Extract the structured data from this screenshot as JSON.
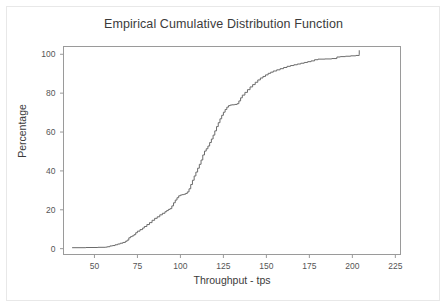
{
  "figure": {
    "width": 447,
    "height": 308,
    "background_color": "#ffffff",
    "border_color": "#e8e8e8",
    "title": "Empirical Cumulative Distribution Function"
  },
  "axes": {
    "title_color": "#3b3b3b",
    "frame_color": "#9a9a9a",
    "tick_label_color": "#555555",
    "line_color": "#6b6b6b"
  },
  "chart_data": {
    "type": "line",
    "title": "Empirical Cumulative Distribution Function",
    "xlabel": "Throughput - tps",
    "ylabel": "Percentage",
    "xlim": [
      32,
      228
    ],
    "ylim": [
      -3,
      104
    ],
    "xticks": [
      50,
      75,
      100,
      125,
      150,
      175,
      200,
      225
    ],
    "xtick_labels": [
      "50",
      "75",
      "100",
      "125",
      "150",
      "175",
      "200",
      "225"
    ],
    "yticks": [
      0,
      20,
      40,
      60,
      80,
      100
    ],
    "ytick_labels": [
      "0",
      "20",
      "40",
      "60",
      "80",
      "100"
    ],
    "grid": false,
    "legend": false,
    "step_style": "post",
    "series": [
      {
        "name": "ECDF",
        "color": "#6b6b6b",
        "line_width": 1,
        "x": [
          37.0,
          45.0,
          52.0,
          56.5,
          57.5,
          59.0,
          60.5,
          62.0,
          63.5,
          65.0,
          66.5,
          68.0,
          69.0,
          70.0,
          71.0,
          72.0,
          73.0,
          74.0,
          75.0,
          76.5,
          78.0,
          79.0,
          80.5,
          82.0,
          83.5,
          85.0,
          86.5,
          88.0,
          89.5,
          91.0,
          92.0,
          93.0,
          94.0,
          95.0,
          96.0,
          97.0,
          98.0,
          99.0,
          100.0,
          101.0,
          102.0,
          103.0,
          104.0,
          105.0,
          106.0,
          107.0,
          108.0,
          109.0,
          110.0,
          111.0,
          112.0,
          113.0,
          114.0,
          115.0,
          116.0,
          117.0,
          118.0,
          119.0,
          120.0,
          121.0,
          122.0,
          123.0,
          124.0,
          125.0,
          126.0,
          127.0,
          128.0,
          129.0,
          130.0,
          131.5,
          133.0,
          134.0,
          135.0,
          136.0,
          137.5,
          139.0,
          140.5,
          142.0,
          143.5,
          145.0,
          146.5,
          148.0,
          149.5,
          151.0,
          152.5,
          154.0,
          156.0,
          158.0,
          160.0,
          162.0,
          164.0,
          166.0,
          168.0,
          170.0,
          172.0,
          174.0,
          176.0,
          178.0,
          180.0,
          184.0,
          188.0,
          191.0,
          193.0,
          196.0,
          199.0,
          202.0,
          204.0
        ],
        "y": [
          0.5,
          0.6,
          0.7,
          0.8,
          1.0,
          1.4,
          1.6,
          2.0,
          2.4,
          2.8,
          3.2,
          3.8,
          4.4,
          5.6,
          6.2,
          6.6,
          7.2,
          8.2,
          9.0,
          9.8,
          10.6,
          11.4,
          12.4,
          13.4,
          14.6,
          15.6,
          16.4,
          17.4,
          18.2,
          19.0,
          19.6,
          20.2,
          20.6,
          22.0,
          23.6,
          25.0,
          26.2,
          27.2,
          27.6,
          27.8,
          28.0,
          28.4,
          29.2,
          30.8,
          33.0,
          35.2,
          37.4,
          39.4,
          41.4,
          43.4,
          45.6,
          48.2,
          50.2,
          51.4,
          52.8,
          54.6,
          56.4,
          58.4,
          60.6,
          62.8,
          64.8,
          66.8,
          68.6,
          70.2,
          71.6,
          72.8,
          73.6,
          73.9,
          74.0,
          74.2,
          74.6,
          76.0,
          77.6,
          79.0,
          80.4,
          81.8,
          83.2,
          84.4,
          85.6,
          86.8,
          87.8,
          88.6,
          89.4,
          90.2,
          90.8,
          91.4,
          92.0,
          92.6,
          93.2,
          93.8,
          94.2,
          94.6,
          95.0,
          95.4,
          95.8,
          96.2,
          96.6,
          97.2,
          97.5,
          97.6,
          97.8,
          98.6,
          98.8,
          99.0,
          99.2,
          99.4,
          100.0
        ]
      }
    ]
  }
}
